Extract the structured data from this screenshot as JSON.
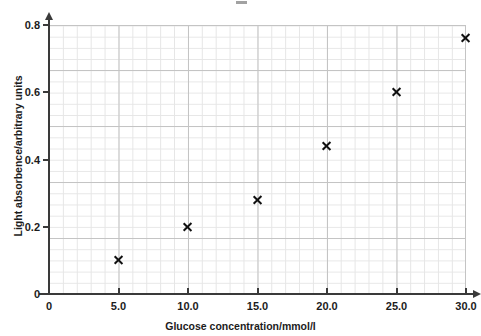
{
  "chart_data": {
    "type": "scatter",
    "title": "",
    "xlabel": "Glucose concentration/mmol/l",
    "ylabel": "Light absorbence/arbitrary units",
    "xlim": [
      0,
      30
    ],
    "ylim": [
      0,
      0.8
    ],
    "grid": true,
    "legend": "none",
    "x_ticks": [
      "0",
      "5.0",
      "10.0",
      "15.0",
      "20.0",
      "25.0",
      "30.0"
    ],
    "x_tick_values": [
      0,
      5,
      10,
      15,
      20,
      25,
      30
    ],
    "y_ticks": [
      "0",
      "0.2",
      "0.4",
      "0.6",
      "0.8"
    ],
    "y_tick_values": [
      0,
      0.2,
      0.4,
      0.6,
      0.8
    ],
    "marker": "x",
    "marker_color": "#111111",
    "x": [
      5.0,
      10.0,
      15.0,
      20.0,
      25.0,
      30.0
    ],
    "values": [
      0.1,
      0.2,
      0.28,
      0.44,
      0.6,
      0.76
    ],
    "points": [
      {
        "x": 5.0,
        "y": 0.1
      },
      {
        "x": 10.0,
        "y": 0.2
      },
      {
        "x": 15.0,
        "y": 0.28
      },
      {
        "x": 20.0,
        "y": 0.44
      },
      {
        "x": 25.0,
        "y": 0.6
      },
      {
        "x": 30.0,
        "y": 0.76
      }
    ]
  },
  "style": {
    "background": "#ffffff",
    "axis_color": "#3a3a3a",
    "grid_minor_color": "#e6e6e6",
    "grid_major_color": "#c4c4c4",
    "text_color": "#1c1c1c"
  }
}
